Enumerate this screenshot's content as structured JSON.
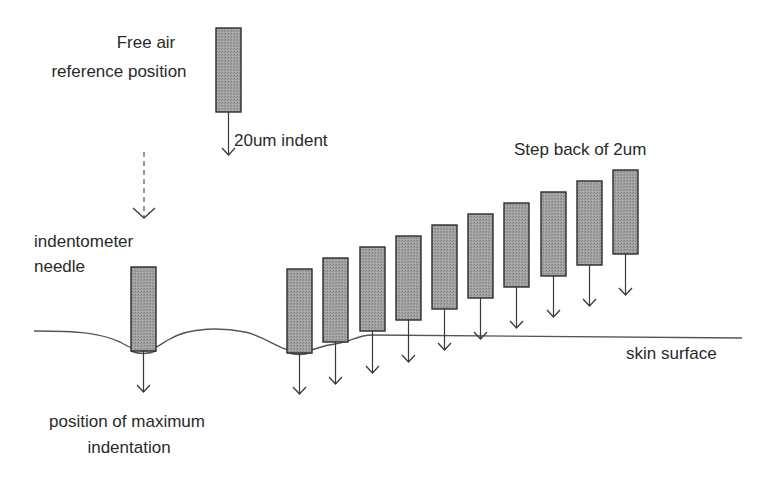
{
  "labels": {
    "free_air_line1": "Free air",
    "free_air_line2": "reference position",
    "indent": "20um indent",
    "step_back": "Step back of 2um",
    "needle_line1": "indentometer",
    "needle_line2": "needle",
    "max_line1": "position of maximum",
    "max_line2": "indentation",
    "skin": "skin surface"
  },
  "colors": {
    "needle_fill": "#9a9a9a",
    "outline": "#2b2b2b",
    "text": "#2a2a2a"
  },
  "diagram": {
    "reference_needle": {
      "x": 216,
      "y": 28,
      "w": 25,
      "h": 84,
      "arrow_to": 155
    },
    "indentometer_needle": {
      "x": 131,
      "y": 267,
      "w": 25,
      "h": 84,
      "arrow_to": 392
    },
    "step_needles": [
      {
        "x": 287,
        "y": 269,
        "arrow_to": 394
      },
      {
        "x": 323,
        "y": 258,
        "arrow_to": 384
      },
      {
        "x": 360,
        "y": 247,
        "arrow_to": 373
      },
      {
        "x": 396,
        "y": 236,
        "arrow_to": 362
      },
      {
        "x": 432,
        "y": 225,
        "arrow_to": 350
      },
      {
        "x": 468,
        "y": 214,
        "arrow_to": 339
      },
      {
        "x": 504,
        "y": 203,
        "arrow_to": 328
      },
      {
        "x": 541,
        "y": 192,
        "arrow_to": 317
      },
      {
        "x": 577,
        "y": 181,
        "arrow_to": 306
      },
      {
        "x": 613,
        "y": 170,
        "arrow_to": 295
      }
    ],
    "needle_size": {
      "w": 25,
      "h": 84
    },
    "step_count": 10
  }
}
